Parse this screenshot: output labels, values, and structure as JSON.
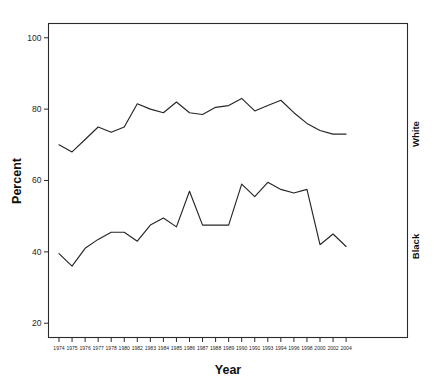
{
  "chart_data": {
    "type": "line",
    "title": "",
    "xlabel": "Year",
    "ylabel": "Percent",
    "xlim": [
      1974,
      2004
    ],
    "ylim": [
      16,
      104
    ],
    "yticks": [
      20,
      40,
      60,
      80,
      100
    ],
    "grid": false,
    "legend_position": "right-inline",
    "categories": [
      "1974",
      "1975",
      "1976",
      "1977",
      "1978",
      "1980",
      "1982",
      "1983",
      "1984",
      "1985",
      "1986",
      "1987",
      "1988",
      "1989",
      "1990",
      "1991",
      "1993",
      "1994",
      "1996",
      "1998",
      "2000",
      "2002",
      "2004"
    ],
    "series": [
      {
        "name": "White",
        "values": [
          70.0,
          68.0,
          71.5,
          75.0,
          73.5,
          75.0,
          81.5,
          80.0,
          79.0,
          82.0,
          79.0,
          78.5,
          80.5,
          81.0,
          83.0,
          79.5,
          81.0,
          82.5,
          79.0,
          76.0,
          74.0,
          73.0,
          73.0
        ]
      },
      {
        "name": "Black",
        "values": [
          39.5,
          36.0,
          41.0,
          43.5,
          45.5,
          45.5,
          43.0,
          47.5,
          49.5,
          47.0,
          57.0,
          47.5,
          47.5,
          47.5,
          59.0,
          55.5,
          59.5,
          57.5,
          56.5,
          57.5,
          42.0,
          45.0,
          41.5
        ]
      }
    ],
    "series_label_colors": [
      "#111111",
      "#111111"
    ],
    "line_color": "#262626",
    "axis_color": "#2b2b2b",
    "background_color": "#ffffff"
  },
  "axes": {
    "y_title": "Percent",
    "x_title": "Year",
    "ytick_labels": [
      "100",
      "80",
      "60",
      "40",
      "20"
    ],
    "xtick_labels": [
      "1974",
      "1975",
      "1976",
      "1977",
      "1978",
      "1980",
      "1982",
      "1983",
      "1984",
      "1985",
      "1986",
      "1987",
      "1988",
      "1989",
      "1990",
      "1991",
      "1993",
      "1994",
      "1996",
      "1998",
      "2000",
      "2002",
      "2004"
    ]
  },
  "labels": {
    "white_series": "White",
    "black_series": "Black"
  }
}
